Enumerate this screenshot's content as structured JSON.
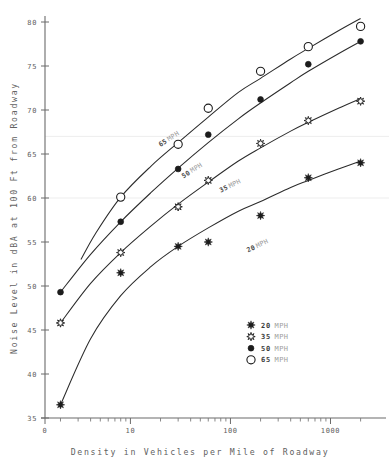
{
  "chart_data": {
    "type": "scatter",
    "title": "",
    "xlabel": "Density in Vehicles per Mile of Roadway",
    "ylabel": "Noise Level in dBA at 100 Ft from Roadway",
    "xscale": "log",
    "yscale": "linear",
    "xlim": [
      1.4,
      2600
    ],
    "ylim": [
      35,
      80
    ],
    "xticks": [
      1,
      10,
      100,
      1000
    ],
    "xticklabels": [
      "0",
      "10",
      "100",
      "1000"
    ],
    "yticks": [
      35,
      40,
      45,
      50,
      55,
      60,
      65,
      70,
      75,
      80
    ],
    "yticklabels": [
      "35",
      "40",
      "45",
      "50",
      "55",
      "60",
      "65",
      "70",
      "75",
      "80"
    ],
    "grid": "light horizontal gridlines at 60 and 67",
    "legend_position": "lower right inside axes",
    "series": [
      {
        "name": "20 MPH",
        "label": "20",
        "unit": "MPH",
        "marker": "star",
        "marker_style": "filled-8-point-star",
        "points": [
          {
            "x": 2.0,
            "y": 36.5
          },
          {
            "x": 8.0,
            "y": 51.5
          },
          {
            "x": 30.0,
            "y": 54.5
          },
          {
            "x": 60.0,
            "y": 55.0
          },
          {
            "x": 200.0,
            "y": 58.0
          },
          {
            "x": 600.0,
            "y": 62.3
          },
          {
            "x": 2000.0,
            "y": 64.0
          }
        ],
        "curve": [
          {
            "x": 2.0,
            "y": 36.5
          },
          {
            "x": 4.0,
            "y": 44.0
          },
          {
            "x": 8.0,
            "y": 48.9
          },
          {
            "x": 16.0,
            "y": 52.2
          },
          {
            "x": 30.0,
            "y": 54.5
          },
          {
            "x": 60.0,
            "y": 56.6
          },
          {
            "x": 120.0,
            "y": 58.5
          },
          {
            "x": 200.0,
            "y": 59.6
          },
          {
            "x": 400.0,
            "y": 61.2
          },
          {
            "x": 600.0,
            "y": 62.0
          },
          {
            "x": 1200.0,
            "y": 63.3
          },
          {
            "x": 2000.0,
            "y": 64.2
          }
        ]
      },
      {
        "name": "35 MPH",
        "label": "35",
        "unit": "MPH",
        "marker": "open-star",
        "marker_style": "open-8-point-star",
        "points": [
          {
            "x": 2.0,
            "y": 45.8
          },
          {
            "x": 8.0,
            "y": 53.8
          },
          {
            "x": 30.0,
            "y": 59.0
          },
          {
            "x": 60.0,
            "y": 62.0
          },
          {
            "x": 200.0,
            "y": 66.2
          },
          {
            "x": 600.0,
            "y": 68.8
          },
          {
            "x": 2000.0,
            "y": 71.0
          }
        ],
        "curve": [
          {
            "x": 2.0,
            "y": 45.8
          },
          {
            "x": 4.0,
            "y": 50.3
          },
          {
            "x": 8.0,
            "y": 53.8
          },
          {
            "x": 16.0,
            "y": 56.8
          },
          {
            "x": 30.0,
            "y": 59.3
          },
          {
            "x": 60.0,
            "y": 61.8
          },
          {
            "x": 120.0,
            "y": 64.2
          },
          {
            "x": 200.0,
            "y": 65.7
          },
          {
            "x": 400.0,
            "y": 67.6
          },
          {
            "x": 600.0,
            "y": 68.6
          },
          {
            "x": 1200.0,
            "y": 70.2
          },
          {
            "x": 2000.0,
            "y": 71.3
          }
        ]
      },
      {
        "name": "50 MPH",
        "label": "50",
        "unit": "MPH",
        "marker": "filled-circle",
        "marker_style": "small-filled-circle",
        "points": [
          {
            "x": 2.0,
            "y": 49.3
          },
          {
            "x": 8.0,
            "y": 57.3
          },
          {
            "x": 30.0,
            "y": 63.3
          },
          {
            "x": 60.0,
            "y": 67.2
          },
          {
            "x": 200.0,
            "y": 71.2
          },
          {
            "x": 600.0,
            "y": 75.2
          },
          {
            "x": 2000.0,
            "y": 77.8
          }
        ],
        "curve": [
          {
            "x": 2.0,
            "y": 49.3
          },
          {
            "x": 4.0,
            "y": 53.6
          },
          {
            "x": 8.0,
            "y": 57.3
          },
          {
            "x": 16.0,
            "y": 60.6
          },
          {
            "x": 30.0,
            "y": 63.4
          },
          {
            "x": 60.0,
            "y": 66.3
          },
          {
            "x": 120.0,
            "y": 69.0
          },
          {
            "x": 200.0,
            "y": 70.8
          },
          {
            "x": 400.0,
            "y": 73.1
          },
          {
            "x": 600.0,
            "y": 74.4
          },
          {
            "x": 1200.0,
            "y": 76.4
          },
          {
            "x": 2000.0,
            "y": 77.8
          }
        ]
      },
      {
        "name": "65 MPH",
        "label": "65",
        "unit": "MPH",
        "marker": "open-circle",
        "marker_style": "large-open-circle",
        "points": [
          {
            "x": 8.0,
            "y": 60.1
          },
          {
            "x": 30.0,
            "y": 66.1
          },
          {
            "x": 60.0,
            "y": 70.2
          },
          {
            "x": 200.0,
            "y": 74.4
          },
          {
            "x": 600.0,
            "y": 77.2
          },
          {
            "x": 2000.0,
            "y": 79.5
          }
        ],
        "curve": [
          {
            "x": 3.2,
            "y": 53.0
          },
          {
            "x": 4.5,
            "y": 56.0
          },
          {
            "x": 8.0,
            "y": 60.1
          },
          {
            "x": 16.0,
            "y": 63.6
          },
          {
            "x": 30.0,
            "y": 66.3
          },
          {
            "x": 60.0,
            "y": 69.2
          },
          {
            "x": 120.0,
            "y": 72.0
          },
          {
            "x": 200.0,
            "y": 73.6
          },
          {
            "x": 400.0,
            "y": 75.8
          },
          {
            "x": 600.0,
            "y": 77.0
          },
          {
            "x": 1200.0,
            "y": 79.0
          },
          {
            "x": 2000.0,
            "y": 80.4
          }
        ]
      }
    ],
    "inline_labels": [
      {
        "text": "65",
        "unit": "MPH",
        "x": 20.0,
        "y": 65.8,
        "rotation": -33
      },
      {
        "text": "50",
        "unit": "MPH",
        "x": 34.0,
        "y": 62.2,
        "rotation": -33
      },
      {
        "text": "35",
        "unit": "MPH",
        "x": 80.0,
        "y": 60.6,
        "rotation": -26
      },
      {
        "text": "20",
        "unit": "MPH",
        "x": 150.0,
        "y": 53.8,
        "rotation": -26
      }
    ]
  },
  "legend": {
    "entries": [
      {
        "label": "20",
        "unit": "MPH",
        "marker": "star"
      },
      {
        "label": "35",
        "unit": "MPH",
        "marker": "open-star"
      },
      {
        "label": "50",
        "unit": "MPH",
        "marker": "filled-circle"
      },
      {
        "label": "65",
        "unit": "MPH",
        "marker": "open-circle"
      }
    ]
  },
  "axes": {
    "x_title": "Density in Vehicles per Mile of Roadway",
    "y_title": "Noise Level in dBA at 100 Ft from Roadway"
  }
}
